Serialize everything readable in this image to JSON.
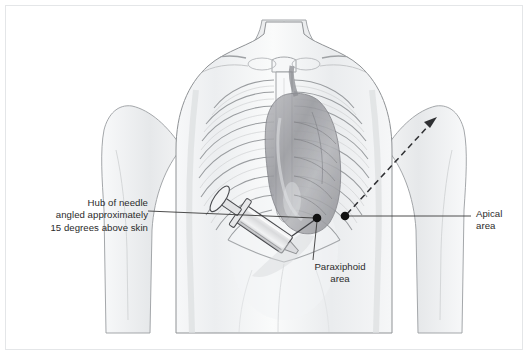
{
  "figure": {
    "background_color": "#ffffff",
    "border_color": "#e4e6e8",
    "line_color": "#3a3a3a",
    "marker_color": "#111111",
    "anatomy_outline_color": "#8f9295",
    "skin_shade_color": "#e9eaec",
    "heart_shade_color": "#a8a9ad"
  },
  "callouts": {
    "needle": {
      "line1": "Hub of needle",
      "line2": "angled approximately",
      "line3": "15 degrees above skin",
      "text": "Hub of needle\nangled approximately\n15 degrees above skin"
    },
    "apical": {
      "line1": "Apical",
      "line2": "area",
      "text": "Apical\narea"
    },
    "paraxiphoid": {
      "line1": "Paraxiphoid",
      "line2": "area",
      "text": "Paraxiphoid\narea"
    }
  },
  "markers": [
    {
      "name": "paraxiphoid-site",
      "x": 317,
      "y": 218
    },
    {
      "name": "apical-site",
      "x": 345,
      "y": 216
    }
  ],
  "leader_lines": [
    {
      "name": "needle-leader",
      "from_x": 148,
      "from_y": 211,
      "to_x": 315,
      "to_y": 218
    },
    {
      "name": "apical-leader",
      "from_x": 347,
      "from_y": 216,
      "to_x": 471,
      "to_y": 216
    },
    {
      "name": "paraxiphoid-leader",
      "from_x": 317,
      "from_y": 220,
      "to_x": 313,
      "to_y": 260
    }
  ],
  "trajectory_arrow": {
    "name": "apical-needle-trajectory",
    "from_x": 347,
    "from_y": 214,
    "to_x": 437,
    "to_y": 117,
    "style": "dashed"
  },
  "anatomy_labels": {
    "torso": "anterior chest and upper abdomen",
    "ribcage": "rib cage with sternum and clavicles",
    "heart": "heart silhouette",
    "syringe": "needle and syringe at paraxiphoid site"
  }
}
